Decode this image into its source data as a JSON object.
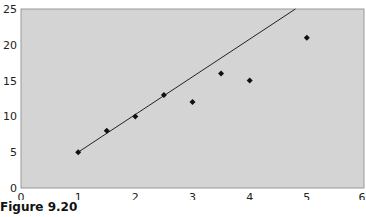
{
  "chart_data": {
    "type": "scatter",
    "title": "",
    "xlabel": "",
    "ylabel": "",
    "xlim": [
      0,
      6
    ],
    "ylim": [
      0,
      25
    ],
    "x_ticks": [
      "0",
      "1",
      "2",
      "3",
      "4",
      "5",
      "6"
    ],
    "y_ticks": [
      "0",
      "5",
      "10",
      "15",
      "20",
      "25"
    ],
    "grid": false,
    "legend": null,
    "series": [
      {
        "name": "data",
        "type": "scatter",
        "points": [
          {
            "x": 1,
            "y": 5
          },
          {
            "x": 1.5,
            "y": 8
          },
          {
            "x": 2,
            "y": 10
          },
          {
            "x": 2.5,
            "y": 13
          },
          {
            "x": 3,
            "y": 12
          },
          {
            "x": 3.5,
            "y": 16
          },
          {
            "x": 4,
            "y": 15
          },
          {
            "x": 5,
            "y": 21
          }
        ]
      },
      {
        "name": "trend line",
        "type": "line",
        "points": [
          {
            "x": 1,
            "y": 5
          },
          {
            "x": 4.8,
            "y": 25
          }
        ]
      }
    ],
    "colors": {
      "plot_background": "#d4d4d4",
      "marker": "#111111",
      "line": "#222222"
    }
  },
  "caption": "Figure 9.20"
}
